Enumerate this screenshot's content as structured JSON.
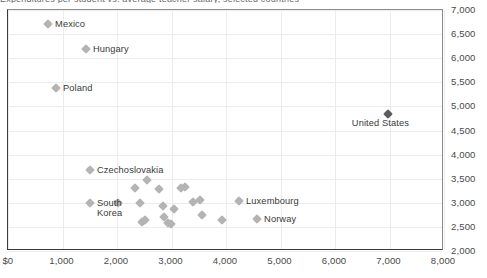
{
  "chart_data": {
    "type": "scatter",
    "title": "",
    "xlabel": "",
    "ylabel": "",
    "xlim": [
      0,
      8000
    ],
    "ylim": [
      2000,
      7000
    ],
    "xticks": [
      "$0",
      "1,000",
      "2,000",
      "3,000",
      "4,000",
      "5,000",
      "6,000",
      "7,000",
      "8,000"
    ],
    "xtick_values": [
      0,
      1000,
      2000,
      3000,
      4000,
      5000,
      6000,
      7000,
      8000
    ],
    "yticks": [
      "2,000",
      "2,500",
      "3,000",
      "3,500",
      "4,000",
      "4,500",
      "5,000",
      "5,500",
      "6,000",
      "6,500",
      "7,000"
    ],
    "ytick_values": [
      2000,
      2500,
      3000,
      3500,
      4000,
      4500,
      5000,
      5500,
      6000,
      6500,
      7000
    ],
    "grid": true,
    "y_axis_position": "right",
    "legend": "none",
    "marker_color": "#b4b4b4",
    "highlight_color": "#5c5c5c",
    "points": [
      {
        "label": "Mexico",
        "x": 735,
        "y": 6700,
        "label_dx": 7,
        "label_dy": -5,
        "highlight": false
      },
      {
        "label": "Hungary",
        "x": 1430,
        "y": 6200,
        "label_dx": 7,
        "label_dy": -5,
        "highlight": false
      },
      {
        "label": "Poland",
        "x": 880,
        "y": 5390,
        "label_dx": 7,
        "label_dy": -5,
        "highlight": false
      },
      {
        "label": "United States",
        "x": 6970,
        "y": 4840,
        "label_dx": -36,
        "label_dy": 4,
        "highlight": true
      },
      {
        "label": "Czechoslovakia",
        "x": 1505,
        "y": 3680,
        "label_dx": 7,
        "label_dy": -5,
        "highlight": false
      },
      {
        "label": "South\nKorea",
        "x": 1505,
        "y": 3000,
        "label_dx": 7,
        "label_dy": -5,
        "highlight": false
      },
      {
        "label": "Luxembourg",
        "x": 4240,
        "y": 3045,
        "label_dx": 7,
        "label_dy": -5,
        "highlight": false
      },
      {
        "label": "Norway",
        "x": 4570,
        "y": 2655,
        "label_dx": 7,
        "label_dy": -5,
        "highlight": false
      },
      {
        "label": "",
        "x": 2330,
        "y": 3300,
        "highlight": false
      },
      {
        "label": "",
        "x": 2550,
        "y": 3480,
        "highlight": false
      },
      {
        "label": "",
        "x": 2770,
        "y": 3290,
        "highlight": false
      },
      {
        "label": "",
        "x": 2420,
        "y": 2990,
        "highlight": false
      },
      {
        "label": "",
        "x": 2840,
        "y": 2930,
        "highlight": false
      },
      {
        "label": "",
        "x": 3180,
        "y": 3310,
        "highlight": false
      },
      {
        "label": "",
        "x": 3250,
        "y": 3320,
        "highlight": false
      },
      {
        "label": "",
        "x": 3400,
        "y": 3020,
        "highlight": false
      },
      {
        "label": "",
        "x": 3530,
        "y": 3060,
        "highlight": false
      },
      {
        "label": "",
        "x": 3050,
        "y": 2880,
        "highlight": false
      },
      {
        "label": "",
        "x": 2860,
        "y": 2700,
        "highlight": false
      },
      {
        "label": "",
        "x": 2930,
        "y": 2580,
        "highlight": false
      },
      {
        "label": "",
        "x": 2990,
        "y": 2550,
        "highlight": false
      },
      {
        "label": "",
        "x": 3560,
        "y": 2740,
        "highlight": false
      },
      {
        "label": "",
        "x": 2460,
        "y": 2610,
        "highlight": false
      },
      {
        "label": "",
        "x": 2520,
        "y": 2640,
        "highlight": false
      },
      {
        "label": "",
        "x": 3930,
        "y": 2640,
        "highlight": false
      },
      {
        "label": "",
        "x": 2020,
        "y": 2990,
        "highlight": false
      }
    ]
  },
  "top_caption": {
    "text": "Expenditures per student vs. average teacher salary, selected countries"
  }
}
